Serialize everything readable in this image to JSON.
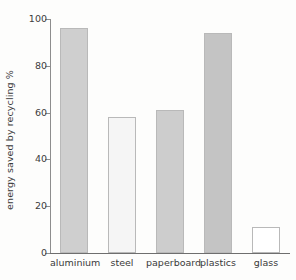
{
  "chart_data": {
    "type": "bar",
    "title": "",
    "xlabel": "",
    "ylabel": "energy saved by recycling %",
    "categories": [
      "aluminium",
      "steel",
      "paperboard",
      "plastics",
      "glass"
    ],
    "values": [
      96,
      58,
      61,
      94,
      11
    ],
    "ylim": [
      0,
      100
    ],
    "yticks": [
      0,
      20,
      40,
      60,
      80,
      100
    ],
    "ytick_labels": [
      "0",
      "20",
      "40",
      "60",
      "80",
      "100"
    ],
    "grid": false,
    "legend": null,
    "bar_colors": [
      "#cfcfcf",
      "#f5f5f5",
      "#cdcdcd",
      "#c4c4c4",
      "#ffffff"
    ],
    "bar_edge_color": "#b9b9b9",
    "axis_color": "#6e6e6e",
    "text_color": "#3a3a3a",
    "background": "#fdfdfc"
  }
}
